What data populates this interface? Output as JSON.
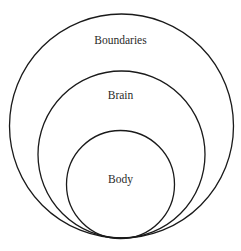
{
  "diagram": {
    "type": "nested-circles",
    "stroke_color": "#1a1a1a",
    "text_color": "#2a2a2a",
    "background": "#ffffff",
    "circles": [
      {
        "id": "outer",
        "label": "Boundaries",
        "cx": 121.5,
        "cy": 126,
        "r": 112,
        "label_y": 44
      },
      {
        "id": "middle",
        "label": "Brain",
        "cx": 121.5,
        "cy": 154.5,
        "r": 83.5,
        "label_y": 99
      },
      {
        "id": "inner",
        "label": "Body",
        "cx": 120.5,
        "cy": 184.5,
        "r": 54,
        "label_y": 183
      }
    ]
  }
}
